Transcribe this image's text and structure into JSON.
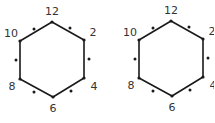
{
  "diagram": {
    "figures": [
      {
        "name": "left-hexagon",
        "vertex_labels": [
          "12",
          "2",
          "4",
          "6",
          "8",
          "10"
        ],
        "odd_positions_marked": [
          "1",
          "3",
          "5",
          "7",
          "9",
          "11"
        ]
      },
      {
        "name": "right-hexagon",
        "vertex_labels": [
          "12",
          "2",
          "4",
          "6",
          "8",
          "10"
        ],
        "odd_positions_marked": [
          "1",
          "3",
          "5",
          "7",
          "9",
          "11"
        ]
      }
    ],
    "colors": {
      "line": "#1a1a1a",
      "text": "#333333",
      "background": "#ffffff"
    }
  }
}
